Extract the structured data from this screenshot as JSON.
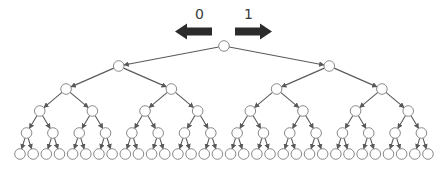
{
  "diagram": {
    "type": "complete-binary-tree",
    "depth": 5,
    "levels": [
      {
        "level": 0,
        "node_count": 1
      },
      {
        "level": 1,
        "node_count": 2
      },
      {
        "level": 2,
        "node_count": 4
      },
      {
        "level": 3,
        "node_count": 8
      },
      {
        "level": 4,
        "node_count": 16
      },
      {
        "level": 5,
        "node_count": 32
      }
    ],
    "total_nodes": 63,
    "branch_labels": {
      "left": {
        "label": "0",
        "direction": "left"
      },
      "right": {
        "label": "1",
        "direction": "right"
      }
    },
    "colors": {
      "arrow": "#2b2b2b",
      "edge": "#5a5a5a",
      "node_stroke": "#8a8a8a",
      "node_fill": "#ffffff",
      "label": "#3a3a3a"
    }
  }
}
